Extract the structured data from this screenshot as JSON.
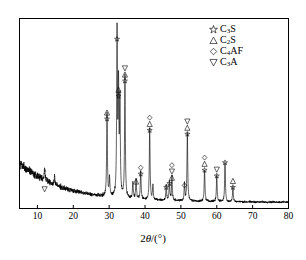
{
  "chart_data": {
    "type": "line",
    "title": "",
    "xlabel": "2θ/(°)",
    "ylabel": "",
    "xlim": [
      5,
      80
    ],
    "ylim": [
      0,
      100
    ],
    "grid": false,
    "x_ticks": [
      10,
      20,
      30,
      40,
      50,
      60,
      70,
      80
    ],
    "y_ticks": [],
    "legend_position": "top-right",
    "legend": [
      {
        "symbol": "star",
        "label": "C3S",
        "label_base": "C",
        "sub": "3",
        "tail": "S"
      },
      {
        "symbol": "triangle-up",
        "label": "C2S",
        "label_base": "C",
        "sub": "2",
        "tail": "S"
      },
      {
        "symbol": "diamond",
        "label": "C4AF",
        "label_base": "C",
        "sub": "4",
        "tail": "AF"
      },
      {
        "symbol": "triangle-down",
        "label": "C3A",
        "label_base": "C",
        "sub": "3",
        "tail": "A"
      }
    ],
    "series": [
      {
        "name": "XRD intensity",
        "x": [
          5,
          80
        ],
        "description": "X-ray diffraction pattern of cement clinker with decaying amorphous background and sharp crystalline peaks"
      }
    ],
    "peaks": [
      {
        "x": 12.0,
        "height": 7,
        "markers": [
          "triangle-down"
        ]
      },
      {
        "x": 14.8,
        "height": 5,
        "markers": []
      },
      {
        "x": 29.4,
        "height": 44,
        "markers": [
          "triangle-up",
          "star"
        ]
      },
      {
        "x": 30.1,
        "height": 10,
        "markers": []
      },
      {
        "x": 32.2,
        "height": 86,
        "markers": [
          "star"
        ]
      },
      {
        "x": 32.6,
        "height": 56,
        "markers": [
          "triangle-up",
          "star"
        ]
      },
      {
        "x": 33.0,
        "height": 50,
        "markers": []
      },
      {
        "x": 34.4,
        "height": 64,
        "markers": [
          "triangle-down",
          "triangle-up",
          "star"
        ]
      },
      {
        "x": 36.6,
        "height": 9,
        "markers": []
      },
      {
        "x": 37.5,
        "height": 11,
        "markers": [
          "triangle-up"
        ]
      },
      {
        "x": 38.8,
        "height": 15,
        "markers": [
          "diamond",
          "star"
        ]
      },
      {
        "x": 41.3,
        "height": 38,
        "markers": [
          "diamond",
          "triangle-up",
          "star"
        ]
      },
      {
        "x": 42.2,
        "height": 8,
        "markers": []
      },
      {
        "x": 45.9,
        "height": 8,
        "markers": [
          "star"
        ]
      },
      {
        "x": 46.8,
        "height": 10,
        "markers": [
          "star"
        ]
      },
      {
        "x": 47.5,
        "height": 13,
        "markers": [
          "diamond",
          "triangle-down",
          "triangle-up"
        ]
      },
      {
        "x": 51.8,
        "height": 36,
        "markers": [
          "triangle-down",
          "triangle-up",
          "star"
        ]
      },
      {
        "x": 51.0,
        "height": 9,
        "markers": [
          "diamond"
        ]
      },
      {
        "x": 56.6,
        "height": 17,
        "markers": [
          "diamond",
          "triangle-up",
          "star"
        ]
      },
      {
        "x": 60.0,
        "height": 14,
        "markers": [
          "triangle-down",
          "star"
        ]
      },
      {
        "x": 62.3,
        "height": 21,
        "markers": [
          "star"
        ]
      },
      {
        "x": 64.5,
        "height": 8,
        "markers": [
          "triangle-up",
          "star"
        ]
      }
    ]
  },
  "axis": {
    "x_title_prefix": "2",
    "x_title_theta": "θ",
    "x_title_suffix": "/(°)"
  },
  "colors": {
    "line": "#000000",
    "frame": "#000000",
    "background": "#ffffff",
    "marker": "#000000"
  }
}
